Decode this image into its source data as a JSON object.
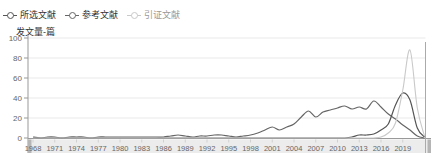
{
  "legend": {
    "items": [
      {
        "label": "所选文献",
        "color": "#555555",
        "text_color": "#333333"
      },
      {
        "label": "参考文献",
        "color": "#666666",
        "text_color": "#333333"
      },
      {
        "label": "引证文献",
        "color": "#c9c9c9",
        "text_color": "#999999"
      }
    ]
  },
  "axis_title": "发文量-篇",
  "chart_data": {
    "type": "line",
    "title": "",
    "ylabel": "发文量-篇",
    "xlabel": "",
    "ylim": [
      0,
      100
    ],
    "grid": true,
    "legend_position": "top-left",
    "x": [
      1968,
      1969,
      1970,
      1971,
      1972,
      1973,
      1974,
      1975,
      1976,
      1977,
      1978,
      1979,
      1980,
      1981,
      1982,
      1983,
      1984,
      1985,
      1986,
      1987,
      1988,
      1989,
      1990,
      1991,
      1992,
      1993,
      1994,
      1995,
      1996,
      1997,
      1998,
      1999,
      2000,
      2001,
      2002,
      2003,
      2004,
      2005,
      2006,
      2007,
      2008,
      2009,
      2010,
      2011,
      2012,
      2013,
      2014,
      2015,
      2016,
      2017,
      2018,
      2019,
      2020,
      2021,
      2022
    ],
    "x_tick_labels": [
      "1968",
      "1971",
      "1974",
      "1977",
      "1980",
      "1983",
      "1986",
      "1989",
      "1992",
      "1995",
      "1998",
      "2001",
      "2004",
      "2007",
      "2010",
      "2013",
      "2016",
      "2019"
    ],
    "y_ticks": [
      0,
      20,
      40,
      60,
      80,
      100
    ],
    "series": [
      {
        "name": "所选文献",
        "color": "#555555",
        "values": [
          0,
          0,
          0,
          0,
          0,
          0,
          0,
          0,
          0,
          0,
          0,
          0,
          0,
          0,
          0,
          0,
          0,
          0,
          0,
          0,
          0,
          0,
          0,
          0,
          0,
          0,
          0,
          0,
          0,
          0,
          0,
          0,
          0,
          0,
          0,
          0,
          0,
          0,
          0,
          0,
          0,
          0,
          0,
          0,
          1,
          3,
          3,
          4,
          8,
          14,
          33,
          45,
          38,
          10,
          1
        ]
      },
      {
        "name": "参考文献",
        "color": "#666666",
        "values": [
          1,
          0,
          1,
          1,
          0,
          1,
          1,
          1,
          0,
          1,
          1,
          1,
          1,
          1,
          1,
          1,
          1,
          1,
          1,
          2,
          3,
          2,
          1,
          2,
          2,
          3,
          3,
          2,
          1,
          2,
          3,
          5,
          8,
          11,
          8,
          11,
          14,
          21,
          27,
          21,
          26,
          28,
          30,
          32,
          29,
          31,
          29,
          37,
          31,
          24,
          19,
          13,
          8,
          2,
          0
        ]
      },
      {
        "name": "引证文献",
        "color": "#c9c9c9",
        "values": [
          0,
          0,
          0,
          0,
          0,
          0,
          0,
          0,
          0,
          0,
          0,
          0,
          0,
          0,
          0,
          0,
          0,
          0,
          0,
          0,
          0,
          0,
          0,
          0,
          0,
          0,
          0,
          0,
          0,
          0,
          0,
          0,
          0,
          0,
          0,
          0,
          0,
          0,
          0,
          0,
          0,
          0,
          0,
          0,
          0,
          0,
          0,
          0,
          1,
          5,
          15,
          48,
          88,
          30,
          2
        ]
      }
    ]
  },
  "chrome_colors": {
    "grid": "#e9e9e9",
    "axis": "#999999",
    "tick_text": "#666666",
    "band": "#ececec",
    "band_tick": "#d0d0d0",
    "handle": "#b5b5b5",
    "right_border": "#aaaaaa"
  }
}
